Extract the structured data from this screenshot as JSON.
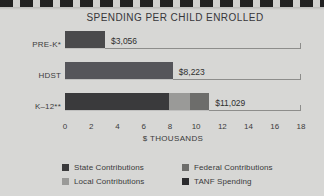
{
  "chart_data": {
    "type": "bar",
    "orientation": "horizontal",
    "stacked": true,
    "title": "SPENDING PER CHILD ENROLLED",
    "xlabel": "$ THOUSANDS",
    "ylabel": "",
    "xlim": [
      0,
      18
    ],
    "xticks": [
      0,
      2,
      4,
      6,
      8,
      10,
      12,
      14,
      16,
      18
    ],
    "grid": false,
    "legend_position": "bottom",
    "categories": [
      "PRE-K*",
      "HDST",
      "K–12**"
    ],
    "series": [
      {
        "name": "State Contributions",
        "color": "#3a3a3c",
        "values": [
          0,
          0,
          7.9
        ]
      },
      {
        "name": "Local Contributions",
        "color": "#9a9a98",
        "values": [
          0,
          0,
          1.6
        ]
      },
      {
        "name": "Federal Contributions",
        "color": "#6d6d6b",
        "values": [
          0,
          0,
          1.5
        ]
      },
      {
        "name": "TANF Spending",
        "color": "#2b2b2d",
        "values": [
          0,
          0,
          0
        ]
      }
    ],
    "bars": [
      {
        "category": "PRE-K*",
        "total": 3.056,
        "value_label": "$3,056",
        "segments": [
          {
            "series": "State Contributions",
            "value": 3.056,
            "color": "#4a4a4c"
          }
        ]
      },
      {
        "category": "HDST",
        "total": 8.223,
        "value_label": "$8,223",
        "segments": [
          {
            "series": "Federal Contributions",
            "value": 8.223,
            "color": "#55555a"
          }
        ]
      },
      {
        "category": "K–12**",
        "total": 11.029,
        "value_label": "$11,029",
        "segments": [
          {
            "series": "State Contributions",
            "value": 7.9,
            "color": "#3a3a3c"
          },
          {
            "series": "Local Contributions",
            "value": 1.6,
            "color": "#9a9a98"
          },
          {
            "series": "Federal Contributions",
            "value": 1.5,
            "color": "#6d6d6b"
          }
        ]
      }
    ],
    "legend": [
      {
        "label": "State Contributions",
        "color": "#3a3a3c"
      },
      {
        "label": "Federal Contributions",
        "color": "#6d6d6b"
      },
      {
        "label": "Local Contributions",
        "color": "#9a9a98"
      },
      {
        "label": "TANF Spending",
        "color": "#2b2b2d"
      }
    ]
  }
}
